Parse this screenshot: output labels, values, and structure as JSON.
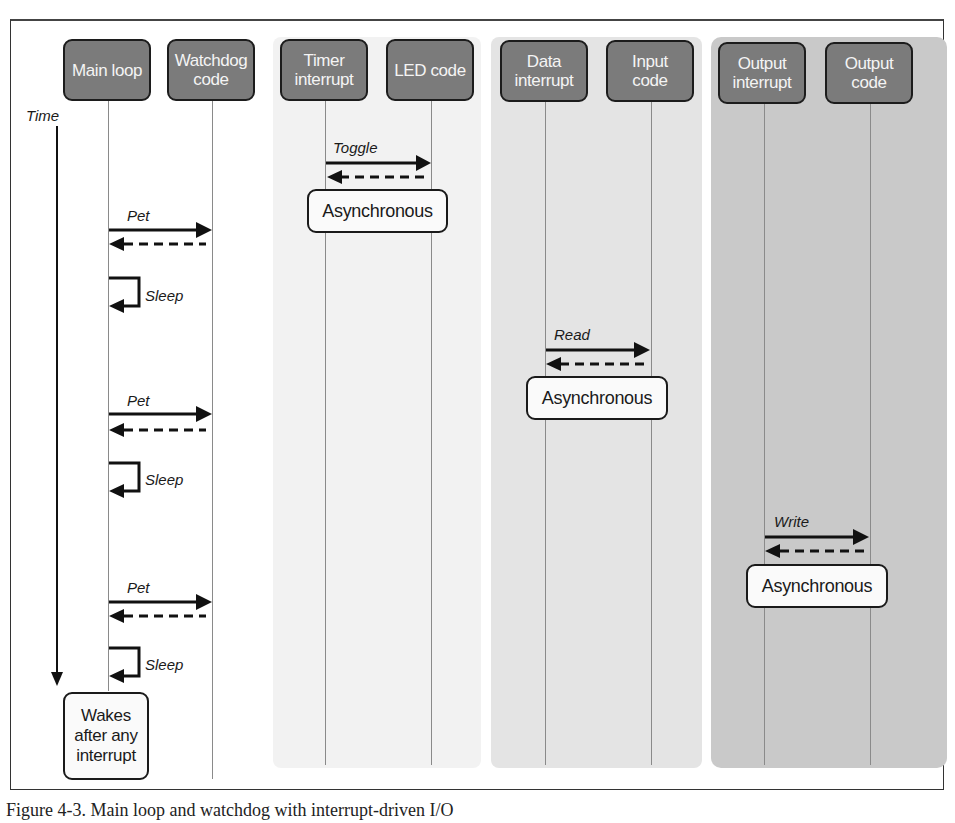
{
  "diagram": {
    "type": "sequence-diagram",
    "time_axis_label": "Time",
    "actors": [
      {
        "id": "main",
        "label": "Main loop"
      },
      {
        "id": "watchdog",
        "label": "Watchdog code"
      },
      {
        "id": "timer",
        "label": "Timer interrupt"
      },
      {
        "id": "led",
        "label": "LED code"
      },
      {
        "id": "data",
        "label": "Data interrupt"
      },
      {
        "id": "input",
        "label": "Input code"
      },
      {
        "id": "outint",
        "label": "Output interrupt"
      },
      {
        "id": "outcode",
        "label": "Output code"
      }
    ],
    "messages": [
      {
        "from": "timer",
        "to": "led",
        "label": "Toggle"
      },
      {
        "from": "main",
        "to": "watchdog",
        "label": "Pet"
      },
      {
        "self": "main",
        "label": "Sleep"
      },
      {
        "from": "data",
        "to": "input",
        "label": "Read"
      },
      {
        "from": "main",
        "to": "watchdog",
        "label": "Pet"
      },
      {
        "self": "main",
        "label": "Sleep"
      },
      {
        "from": "outint",
        "to": "outcode",
        "label": "Write"
      },
      {
        "from": "main",
        "to": "watchdog",
        "label": "Pet"
      },
      {
        "self": "main",
        "label": "Sleep"
      }
    ],
    "notes": [
      {
        "label": "Asynchronous"
      },
      {
        "label": "Asynchronous"
      },
      {
        "label": "Asynchronous"
      },
      {
        "label": "Wakes after any interrupt"
      }
    ]
  },
  "labels": {
    "main_loop": "Main loop",
    "watchdog_l1": "Watchdog",
    "watchdog_l2": "code",
    "timer_l1": "Timer",
    "timer_l2": "interrupt",
    "led": "LED code",
    "data_l1": "Data",
    "data_l2": "interrupt",
    "input_l1": "Input",
    "input_l2": "code",
    "outint_l1": "Output",
    "outint_l2": "interrupt",
    "outcode_l1": "Output",
    "outcode_l2": "code",
    "time": "Time",
    "toggle": "Toggle",
    "read": "Read",
    "write": "Write",
    "pet": "Pet",
    "sleep": "Sleep",
    "async": "Asynchronous",
    "wakes_l1": "Wakes",
    "wakes_l2": "after any",
    "wakes_l3": "interrupt"
  },
  "caption": "Figure 4-3. Main loop and watchdog with interrupt-driven I/O"
}
